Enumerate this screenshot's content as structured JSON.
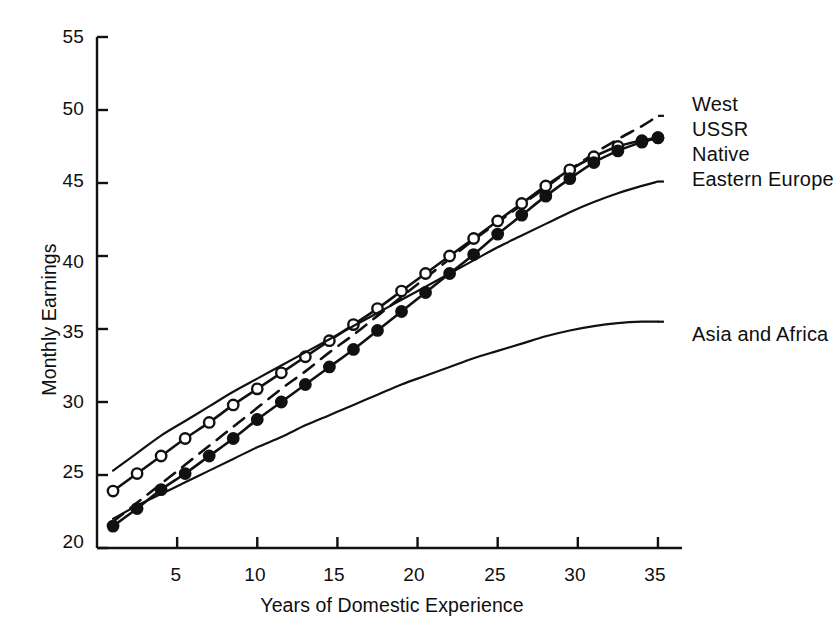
{
  "chart_data": {
    "type": "line",
    "title": "",
    "subtitle": "",
    "xlabel": "Years of Domestic Experience",
    "ylabel": "Monthly Earnings",
    "xlim": [
      0,
      36.5
    ],
    "ylim": [
      20,
      55
    ],
    "xticks": [
      5,
      10,
      15,
      20,
      25,
      30,
      35
    ],
    "yticks": [
      20,
      25,
      30,
      35,
      40,
      45,
      50,
      55
    ],
    "xtick_labels": [
      "5",
      "10",
      "15",
      "20",
      "25",
      "30",
      "35"
    ],
    "ytick_labels": [
      "20",
      "25",
      "30",
      "35",
      "40",
      "45",
      "50",
      "55"
    ],
    "grid": false,
    "legend_position": "right-inline-labels",
    "x": [
      1,
      2.5,
      4,
      5.5,
      7,
      8.5,
      10,
      11.5,
      13,
      14.5,
      16,
      17.5,
      19,
      20.5,
      22,
      23.5,
      25,
      26.5,
      28,
      29.5,
      31,
      32.5,
      34,
      35
    ],
    "series": [
      {
        "name": "West",
        "style": "dashed",
        "marker": "none",
        "color": "#111111",
        "values": [
          21.8,
          23.1,
          24.4,
          25.7,
          27.0,
          28.3,
          29.6,
          30.9,
          32.1,
          33.4,
          34.6,
          35.9,
          37.2,
          38.5,
          39.8,
          41.1,
          42.3,
          43.5,
          44.7,
          45.9,
          47.0,
          48.0,
          48.9,
          49.6
        ]
      },
      {
        "name": "USSR",
        "style": "solid",
        "marker": "open-circle",
        "color": "#111111",
        "values": [
          23.9,
          25.1,
          26.3,
          27.5,
          28.6,
          29.8,
          30.9,
          32.0,
          33.1,
          34.2,
          35.3,
          36.4,
          37.6,
          38.8,
          40.0,
          41.2,
          42.4,
          43.6,
          44.8,
          45.9,
          46.8,
          47.5,
          47.9,
          48.1
        ]
      },
      {
        "name": "Native",
        "style": "solid",
        "marker": "filled-circle",
        "color": "#111111",
        "values": [
          21.5,
          22.7,
          24.0,
          25.1,
          26.3,
          27.5,
          28.8,
          30.0,
          31.2,
          32.4,
          33.6,
          34.9,
          36.2,
          37.5,
          38.8,
          40.1,
          41.5,
          42.8,
          44.1,
          45.3,
          46.4,
          47.2,
          47.8,
          48.1
        ]
      },
      {
        "name": "Eastern Europe",
        "style": "solid",
        "marker": "none",
        "color": "#111111",
        "values": [
          25.3,
          26.5,
          27.7,
          28.7,
          29.7,
          30.7,
          31.6,
          32.5,
          33.4,
          34.3,
          35.2,
          36.1,
          37.0,
          37.9,
          38.8,
          39.7,
          40.6,
          41.4,
          42.2,
          43.0,
          43.7,
          44.3,
          44.8,
          45.1
        ]
      },
      {
        "name": "Asia and Africa",
        "style": "solid",
        "marker": "none",
        "color": "#111111",
        "values": [
          22.0,
          22.9,
          23.7,
          24.5,
          25.3,
          26.1,
          26.9,
          27.6,
          28.4,
          29.1,
          29.8,
          30.5,
          31.2,
          31.8,
          32.4,
          33.0,
          33.5,
          34.0,
          34.5,
          34.9,
          35.2,
          35.4,
          35.5,
          35.5
        ]
      }
    ],
    "annotations": [
      {
        "text": "West",
        "x": 36.8,
        "y": 50.0
      },
      {
        "text": "USSR",
        "x": 36.8,
        "y": 48.3
      },
      {
        "text": "Native",
        "x": 36.8,
        "y": 46.6
      },
      {
        "text": "Eastern Europe",
        "x": 36.8,
        "y": 44.8
      },
      {
        "text": "Asia and Africa",
        "x": 36.8,
        "y": 35.4
      }
    ]
  },
  "legend": {
    "items": [
      {
        "label": "West",
        "style": "dashed",
        "marker": "none"
      },
      {
        "label": "USSR",
        "style": "solid",
        "marker": "open-circle"
      },
      {
        "label": "Native",
        "style": "solid",
        "marker": "filled-circle"
      },
      {
        "label": "Eastern Europe",
        "style": "solid",
        "marker": "none"
      },
      {
        "label": "Asia and Africa",
        "style": "solid",
        "marker": "none"
      }
    ]
  }
}
